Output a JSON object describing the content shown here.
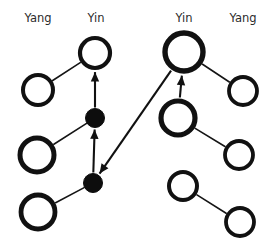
{
  "figure": {
    "background_color": "#ffffff",
    "stroke_color": "#111111",
    "width": 273,
    "height": 250
  },
  "column_labels": [
    {
      "id": "label-yang-left",
      "text": "Yang",
      "x": 38,
      "y": 22
    },
    {
      "id": "label-yin-left",
      "text": "Yin",
      "x": 96,
      "y": 22
    },
    {
      "id": "label-yin-right",
      "text": "Yin",
      "x": 184,
      "y": 22
    },
    {
      "id": "label-yang-right",
      "text": "Yang",
      "x": 243,
      "y": 22
    }
  ],
  "nodes": [
    {
      "id": "n-l1",
      "type": "open",
      "cx": 38,
      "cy": 90,
      "r": 15,
      "stroke_width": 4.0
    },
    {
      "id": "n-l2",
      "type": "open",
      "cx": 37,
      "cy": 155,
      "r": 17,
      "stroke_width": 5.0
    },
    {
      "id": "n-l3",
      "type": "open",
      "cx": 38,
      "cy": 212,
      "r": 17,
      "stroke_width": 4.8
    },
    {
      "id": "n-c1",
      "type": "open",
      "cx": 95,
      "cy": 53,
      "r": 15,
      "stroke_width": 4.2
    },
    {
      "id": "n-c2",
      "type": "filled",
      "cx": 95,
      "cy": 118,
      "r": 9.5,
      "stroke_width": 1.0
    },
    {
      "id": "n-c3",
      "type": "filled",
      "cx": 93,
      "cy": 183,
      "r": 9.5,
      "stroke_width": 1.0
    },
    {
      "id": "n-r1",
      "type": "open",
      "cx": 184,
      "cy": 52,
      "r": 19,
      "stroke_width": 5.4
    },
    {
      "id": "n-r2",
      "type": "open",
      "cx": 178,
      "cy": 118,
      "r": 17,
      "stroke_width": 5.2
    },
    {
      "id": "n-r3",
      "type": "open",
      "cx": 183,
      "cy": 186,
      "r": 14,
      "stroke_width": 4.0
    },
    {
      "id": "n-f1",
      "type": "open",
      "cx": 243,
      "cy": 91,
      "r": 14,
      "stroke_width": 3.8
    },
    {
      "id": "n-f2",
      "type": "open",
      "cx": 239,
      "cy": 155,
      "r": 14,
      "stroke_width": 3.8
    },
    {
      "id": "n-f3",
      "type": "open",
      "cx": 240,
      "cy": 222,
      "r": 14,
      "stroke_width": 3.8
    }
  ],
  "edges": [
    {
      "id": "e-l1-c1",
      "from": "n-l1",
      "to": "n-c1",
      "arrow": false
    },
    {
      "id": "e-l2-c2",
      "from": "n-l2",
      "to": "n-c2",
      "arrow": false
    },
    {
      "id": "e-l3-c3",
      "from": "n-l3",
      "to": "n-c3",
      "arrow": false
    },
    {
      "id": "e-c2-c1",
      "from": "n-c2",
      "to": "n-c1",
      "arrow": true
    },
    {
      "id": "e-c3-c2",
      "from": "n-c3",
      "to": "n-c2",
      "arrow": true
    },
    {
      "id": "e-r1-c3",
      "from": "n-r1",
      "to": "n-c3",
      "arrow": true
    },
    {
      "id": "e-r2-r1",
      "from": "n-r2",
      "to": "n-r1",
      "arrow": true
    },
    {
      "id": "e-r1-f1",
      "from": "n-r1",
      "to": "n-f1",
      "arrow": false
    },
    {
      "id": "e-r2-f2",
      "from": "n-r2",
      "to": "n-f2",
      "arrow": false
    },
    {
      "id": "e-r3-f3",
      "from": "n-r3",
      "to": "n-f3",
      "arrow": false
    }
  ]
}
